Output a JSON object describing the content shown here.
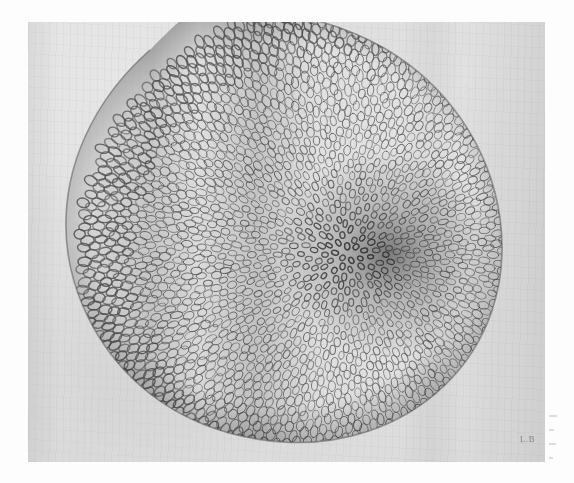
{
  "plate": {
    "kind": "scanned-photographic-plate",
    "signature": "L.B",
    "paper_color": "#dedede",
    "border_color": "#fdfdfd",
    "ink_color": "#4a4a4a",
    "plate_left": 28,
    "plate_top": 22,
    "plate_width": 517,
    "plate_height": 440
  },
  "specimen": {
    "subject": "phyllotaxis-spiral-apex",
    "description": "Dense radiating arrangement of scale-like primordia on a broad shield-shaped apex, with a tight spiral vortex right of centre.",
    "outline_shape": "heart-shield",
    "centre_x": 318,
    "centre_y": 232,
    "scale_ink": "#555555",
    "scale_count": 2600
  },
  "margin": {
    "marks_label": "faint bleed-through marks",
    "mark_count": 4
  }
}
